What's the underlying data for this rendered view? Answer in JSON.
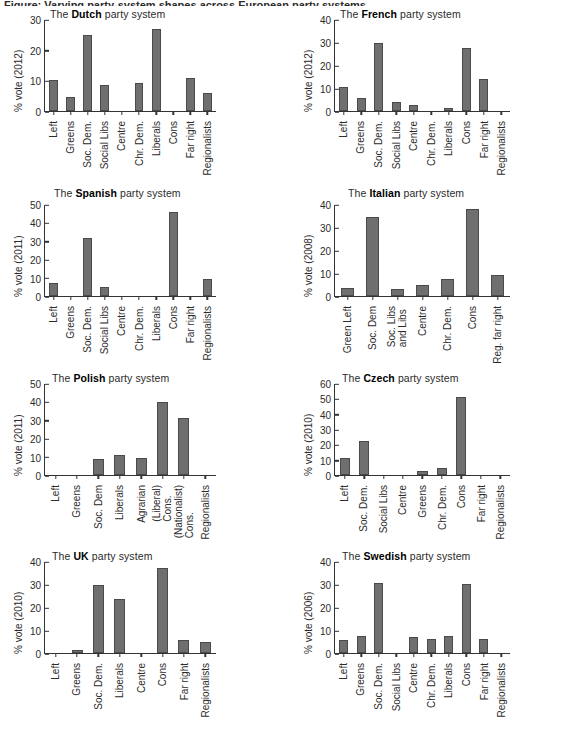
{
  "figure": {
    "cropped_caption_fragment": "Figure: Varying party-system shapes across European party systems",
    "bar_color": "#6f6f6f",
    "bar_edge_color": "#4a4a4a",
    "axis_color": "#333333",
    "text_color": "#2b2b2b"
  },
  "panels": [
    {
      "title_prefix": "The ",
      "country": "Dutch",
      "title_suffix": " party system",
      "ylabel": "% vote (2012)"
    },
    {
      "title_prefix": "The ",
      "country": "French",
      "title_suffix": " party system",
      "ylabel": "% vote (2012)"
    },
    {
      "title_prefix": "The ",
      "country": "Spanish",
      "title_suffix": " party system",
      "ylabel": "% vote (2011)"
    },
    {
      "title_prefix": "The ",
      "country": "Italian",
      "title_suffix": " party system",
      "ylabel": "% vote (2008)"
    },
    {
      "title_prefix": "The ",
      "country": "Polish",
      "title_suffix": " party system",
      "ylabel": "% vote (2011)"
    },
    {
      "title_prefix": "The ",
      "country": "Czech",
      "title_suffix": " party system",
      "ylabel": "% vote (2010)"
    },
    {
      "title_prefix": "The ",
      "country": "UK",
      "title_suffix": " party system",
      "ylabel": "% vote (2010)"
    },
    {
      "title_prefix": "The ",
      "country": "Swedish",
      "title_suffix": " party system",
      "ylabel": "% vote (2006)"
    }
  ],
  "chart_data": [
    {
      "type": "bar",
      "title": "The Dutch party system",
      "xlabel": "",
      "ylabel": "% vote (2012)",
      "ylim": [
        0,
        30
      ],
      "yticks": [
        0,
        10,
        20,
        30
      ],
      "grid": false,
      "categories": [
        "Left",
        "Greens",
        "Soc. Dem.",
        "Social Libs",
        "Centre",
        "Chr. Dem.",
        "Liberals",
        "Cons",
        "Far right",
        "Regionalists"
      ],
      "values": [
        10.2,
        4.5,
        24.8,
        8.5,
        0,
        9.0,
        26.8,
        0,
        10.7,
        5.8
      ]
    },
    {
      "type": "bar",
      "title": "The French party system",
      "xlabel": "",
      "ylabel": "% vote (2012)",
      "ylim": [
        0,
        40
      ],
      "yticks": [
        0,
        10,
        20,
        30,
        40
      ],
      "grid": false,
      "categories": [
        "Left",
        "Greens",
        "Soc. Dem.",
        "Social Libs",
        "Centre",
        "Chr. Dem.",
        "Liberals",
        "Cons",
        "Far right",
        "Regionalists"
      ],
      "values": [
        10.3,
        5.5,
        29.4,
        3.8,
        2.4,
        0,
        1.3,
        27.2,
        13.9,
        0
      ]
    },
    {
      "type": "bar",
      "title": "The Spanish party system",
      "xlabel": "",
      "ylabel": "% vote (2011)",
      "ylim": [
        0,
        50
      ],
      "yticks": [
        0,
        10,
        20,
        30,
        40,
        50
      ],
      "grid": false,
      "categories": [
        "Left",
        "Greens",
        "Soc. Dem.",
        "Social Libs",
        "Centre",
        "Chr. Dem.",
        "Liberals",
        "Cons",
        "Far right",
        "Regionalists"
      ],
      "values": [
        6.9,
        0,
        31.8,
        5.0,
        0,
        0,
        0,
        45.8,
        0,
        9.5
      ]
    },
    {
      "type": "bar",
      "title": "The Italian party system",
      "xlabel": "",
      "ylabel": "% vote (2008)",
      "ylim": [
        0,
        40
      ],
      "yticks": [
        0,
        10,
        20,
        30,
        40
      ],
      "grid": false,
      "categories": [
        "Green Left",
        "Soc. Dem",
        "Soc. Libs\nand Libs",
        "Centre",
        "Chr. Dem.",
        "Cons",
        "Reg. far right"
      ],
      "values": [
        3.5,
        34.5,
        3.1,
        5.0,
        7.5,
        37.9,
        9.0
      ]
    },
    {
      "type": "bar",
      "title": "The Polish party system",
      "xlabel": "",
      "ylabel": "% vote (2011)",
      "ylim": [
        0,
        50
      ],
      "yticks": [
        0,
        10,
        20,
        30,
        40,
        50
      ],
      "grid": false,
      "categories": [
        "Left",
        "Greens",
        "Soc. Dem",
        "Liberals",
        "Agrarian",
        "(Liberal)\nCons.",
        "(Nationalist)\nCons.",
        "Regionalists"
      ],
      "values": [
        0,
        0,
        8.8,
        10.7,
        9.4,
        39.9,
        31.0,
        0
      ]
    },
    {
      "type": "bar",
      "title": "The Czech party system",
      "xlabel": "",
      "ylabel": "% vote (2010)",
      "ylim": [
        0,
        60
      ],
      "yticks": [
        0,
        10,
        20,
        30,
        40,
        50,
        60
      ],
      "grid": false,
      "categories": [
        "Left",
        "Soc. Dem.",
        "Social Libs",
        "Centre",
        "Greens",
        "Chr. Dem.",
        "Cons",
        "Far right",
        "Regionalists"
      ],
      "values": [
        11.3,
        22.1,
        0,
        0,
        2.4,
        4.4,
        51.2,
        0,
        0
      ]
    },
    {
      "type": "bar",
      "title": "The UK party system",
      "xlabel": "",
      "ylabel": "% vote (2010)",
      "ylim": [
        0,
        40
      ],
      "yticks": [
        0,
        10,
        20,
        30,
        40
      ],
      "grid": false,
      "categories": [
        "Left",
        "Greens",
        "Soc. Dem.",
        "Liberals",
        "Centre",
        "Cons",
        "Far right",
        "Regionalists"
      ],
      "values": [
        0,
        1.2,
        29.6,
        23.6,
        0,
        36.8,
        5.8,
        5.0
      ]
    },
    {
      "type": "bar",
      "title": "The Swedish party system",
      "xlabel": "",
      "ylabel": "% vote (2006)",
      "ylim": [
        0,
        40
      ],
      "yticks": [
        0,
        10,
        20,
        30,
        40
      ],
      "grid": false,
      "categories": [
        "Left",
        "Greens",
        "Soc. Dem.",
        "Social Libs",
        "Centre",
        "Chr. Dem.",
        "Liberals",
        "Cons",
        "Far right",
        "Regionalists"
      ],
      "values": [
        5.8,
        7.2,
        30.5,
        0,
        7.0,
        6.1,
        7.5,
        30.2,
        6.2,
        0
      ]
    }
  ]
}
